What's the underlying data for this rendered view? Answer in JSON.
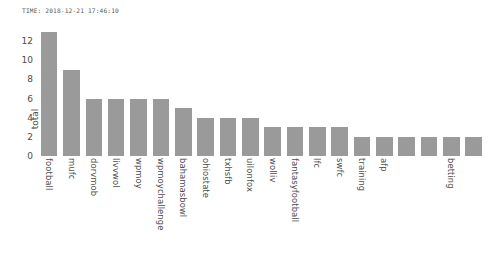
{
  "figure": {
    "timestamp_text": "TIME: 2018-12-21 17:46:10",
    "background_color": "#ffffff",
    "bar_color": "#9a9a9a",
    "text_color": "#4d4d4d"
  },
  "chart_data": {
    "type": "bar",
    "title": "TIME: 2018-12-21 17:46:10",
    "xlabel": "",
    "ylabel": "total",
    "ylim": [
      0,
      13.8
    ],
    "yticks": [
      0,
      2,
      4,
      6,
      8,
      10,
      12
    ],
    "grid": false,
    "legend": null,
    "orientation": "vertical",
    "categories": [
      "football",
      "mufc",
      "dorvmob",
      "livvwol",
      "wpmoy",
      "wpmoychallenge",
      "bahamasbowl",
      "ohiostate",
      "txhsfb",
      "uilonfox",
      "wolliv",
      "fantasyfootball",
      "lfc",
      "swfc",
      "training",
      "afp",
      "",
      "",
      "betting",
      ""
    ],
    "tick_labels_shown": [
      "football",
      "mufc",
      "dorvmob",
      "livvwol",
      "wpmoy",
      "wpmoychallenge",
      "bahamasbowl",
      "ohiostate",
      "txhsfb",
      "uilonfox",
      "wolliv",
      "fantasyfootball",
      "lfc",
      "swfc",
      "training",
      "afp",
      "",
      "",
      "betting",
      ""
    ],
    "values": [
      13,
      9,
      6,
      6,
      6,
      6,
      5,
      4,
      4,
      4,
      3,
      3,
      3,
      3,
      2,
      2,
      2,
      2,
      2,
      2
    ]
  }
}
